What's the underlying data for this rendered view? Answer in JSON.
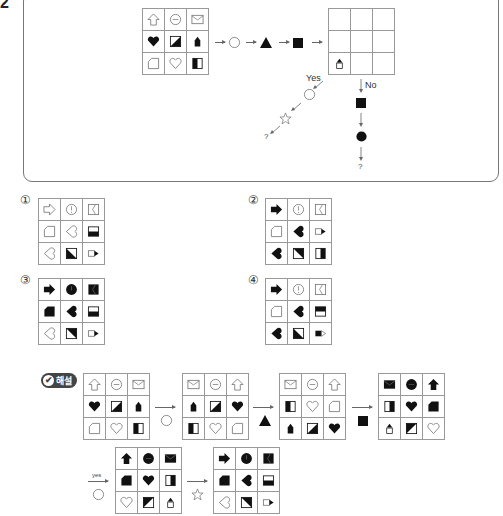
{
  "question": {
    "number": "2",
    "flow": {
      "steps": [
        "circle",
        "triangle-filled",
        "square-filled"
      ],
      "branch_yes_label": "Yes",
      "branch_no_label": "No",
      "yes_steps": [
        "circle",
        "star"
      ],
      "no_steps": [
        "square-filled",
        "circle-filled"
      ],
      "question_mark": "?"
    },
    "input_grid": [
      [
        "arrow-up-outline",
        "face-outline",
        "envelope-outline"
      ],
      [
        "heart-filled",
        "diag-half-br",
        "pencil-filled"
      ],
      [
        "note-outline",
        "heart-outline",
        "half-left-filled"
      ]
    ],
    "output_grid": [
      [
        "",
        "",
        ""
      ],
      [
        "",
        "",
        ""
      ],
      [
        "pencil-outline-tip",
        "",
        ""
      ]
    ]
  },
  "options": [
    {
      "label": "①",
      "grid": [
        [
          "arrow-right-outline",
          "clock-outline",
          "bracket-outline"
        ],
        [
          "note-outline",
          "heart-left-outline",
          "half-bottom-filled"
        ],
        [
          "heart-left-outline",
          "diag-half-bl",
          "pencil-right-outline"
        ]
      ]
    },
    {
      "label": "②",
      "grid": [
        [
          "arrow-right-filled",
          "clock-outline",
          "bracket-outline"
        ],
        [
          "note-outline",
          "heart-left-filled",
          "pencil-right-outline"
        ],
        [
          "heart-left-filled",
          "diag-half-tr",
          "half-right-filled"
        ]
      ]
    },
    {
      "label": "③",
      "grid": [
        [
          "arrow-right-filled",
          "clock-filled",
          "bracket-filled"
        ],
        [
          "note-filled",
          "heart-left-filled",
          "half-bottom-filled"
        ],
        [
          "heart-left-outline",
          "diag-half-tr",
          "pencil-right-outline"
        ]
      ]
    },
    {
      "label": "④",
      "grid": [
        [
          "arrow-right-filled",
          "clock-outline",
          "bracket-outline"
        ],
        [
          "note-outline",
          "heart-left-filled",
          "half-top-filled"
        ],
        [
          "heart-left-filled",
          "diag-half-bl",
          "pencil-right-filled"
        ]
      ]
    }
  ],
  "solution": {
    "badge": "해설",
    "badge_icon": "check-icon",
    "yes_label": "yes",
    "grids": [
      [
        [
          "arrow-up-outline",
          "face-outline",
          "envelope-outline"
        ],
        [
          "heart-filled",
          "diag-half-br",
          "pencil-filled"
        ],
        [
          "note-outline",
          "heart-outline",
          "half-left-filled"
        ]
      ],
      [
        [
          "envelope-outline",
          "face-outline",
          "arrow-up-outline"
        ],
        [
          "pencil-filled",
          "diag-half-br",
          "heart-filled"
        ],
        [
          "half-left-filled",
          "heart-outline",
          "note-outline"
        ]
      ],
      [
        [
          "envelope-outline",
          "face-outline",
          "arrow-up-outline"
        ],
        [
          "half-left-filled",
          "heart-outline",
          "note-outline"
        ],
        [
          "pencil-filled",
          "diag-half-br",
          "heart-filled"
        ]
      ],
      [
        [
          "envelope-filled",
          "face-filled",
          "arrow-up-filled"
        ],
        [
          "half-right-filled",
          "heart-filled",
          "note-filled"
        ],
        [
          "pencil-outline-tip",
          "diag-half-tl",
          "heart-outline"
        ]
      ],
      [
        [
          "arrow-up-filled",
          "face-filled",
          "envelope-filled"
        ],
        [
          "note-filled",
          "heart-filled",
          "half-right-filled"
        ],
        [
          "heart-outline",
          "diag-half-tl",
          "pencil-outline-tip"
        ]
      ],
      [
        [
          "arrow-right-filled",
          "clock-filled",
          "bracket-filled"
        ],
        [
          "note-filled",
          "heart-left-filled",
          "half-bottom-filled"
        ],
        [
          "heart-left-outline",
          "diag-half-tr",
          "pencil-right-outline"
        ]
      ]
    ],
    "operators": [
      "circle",
      "triangle-filled",
      "square-filled",
      "circle",
      "star"
    ]
  }
}
